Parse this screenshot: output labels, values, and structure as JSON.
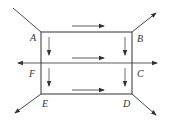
{
  "diagram": {
    "type": "flow-network",
    "nodes": [
      {
        "id": "A",
        "label": "A",
        "x": 41,
        "y": 32
      },
      {
        "id": "B",
        "label": "B",
        "x": 132,
        "y": 32
      },
      {
        "id": "C",
        "label": "C",
        "x": 132,
        "y": 63
      },
      {
        "id": "D",
        "label": "D",
        "x": 132,
        "y": 94
      },
      {
        "id": "E",
        "label": "E",
        "x": 41,
        "y": 94
      },
      {
        "id": "F",
        "label": "F",
        "x": 41,
        "y": 63
      }
    ],
    "edges": [
      {
        "from": "A",
        "to": "B"
      },
      {
        "from": "B",
        "to": "C"
      },
      {
        "from": "C",
        "to": "D"
      },
      {
        "from": "D",
        "to": "E"
      },
      {
        "from": "E",
        "to": "F"
      },
      {
        "from": "F",
        "to": "A"
      },
      {
        "from": "F",
        "to": "C"
      }
    ],
    "external_lines": [
      {
        "at": "A",
        "direction": "in-from-upper-left"
      },
      {
        "at": "B",
        "direction": "out-to-upper-right"
      },
      {
        "at": "D",
        "direction": "out-to-lower-right"
      },
      {
        "at": "E",
        "direction": "out-to-lower-left"
      },
      {
        "at": "F",
        "direction": "out-to-left"
      },
      {
        "at": "C",
        "direction": "out-to-right"
      }
    ],
    "flow_arrows": [
      {
        "position": "above AB",
        "direction": "right"
      },
      {
        "position": "above FC",
        "direction": "right"
      },
      {
        "position": "above ED",
        "direction": "right"
      },
      {
        "position": "right of AF",
        "direction": "down"
      },
      {
        "position": "right of FE",
        "direction": "down"
      },
      {
        "position": "left of BC",
        "direction": "down"
      },
      {
        "position": "left of CD",
        "direction": "down"
      }
    ],
    "colors": {
      "line": "#333333",
      "background": "#ffffff"
    }
  },
  "labels": {
    "A": "A",
    "B": "B",
    "C": "C",
    "D": "D",
    "E": "E",
    "F": "F"
  }
}
